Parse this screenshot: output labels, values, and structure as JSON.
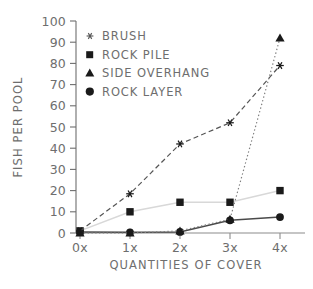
{
  "chart_data": {
    "type": "line",
    "title": "",
    "xlabel": "QUANTITIES OF COVER",
    "ylabel": "FISH PER POOL",
    "categories": [
      "0x",
      "1x",
      "2x",
      "3x",
      "4x"
    ],
    "x": [
      0,
      1,
      2,
      3,
      4
    ],
    "xlim": [
      -0.22,
      4.32
    ],
    "ylim": [
      0,
      100
    ],
    "yticks": [
      0,
      10,
      20,
      30,
      40,
      50,
      60,
      70,
      80,
      90,
      100
    ],
    "ytick_labels": [
      "0",
      "10",
      "20",
      "30",
      "40",
      "50",
      "60",
      "70",
      "80",
      "90",
      "100"
    ],
    "xtick_labels": [
      "0x",
      "1x",
      "2x",
      "3x",
      "4x"
    ],
    "grid": false,
    "legend_position": "upper-left-inside",
    "series": [
      {
        "name": "BRUSH",
        "marker": "asterisk",
        "linestyle": "dashed",
        "color": "#555555",
        "values": [
          1,
          18.5,
          42,
          52,
          79
        ]
      },
      {
        "name": "ROCK PILE",
        "marker": "square",
        "linestyle": "solid",
        "color": "#d8d8d8",
        "values": [
          1,
          10,
          14.5,
          14.5,
          20
        ]
      },
      {
        "name": "SIDE OVERHANG",
        "marker": "triangle",
        "linestyle": "dotted",
        "color": "#808080",
        "values": [
          0,
          0,
          1,
          6.5,
          92
        ]
      },
      {
        "name": "ROCK LAYER",
        "marker": "circle",
        "linestyle": "solid",
        "color": "#4a4a4a",
        "values": [
          0.5,
          0.3,
          0.5,
          6,
          7.5
        ]
      }
    ]
  },
  "axes": {
    "y_title": "FISH PER POOL",
    "x_title": "QUANTITIES OF COVER",
    "y_ticks": [
      "100",
      "90",
      "80",
      "70",
      "60",
      "50",
      "40",
      "30",
      "20",
      "10",
      "0"
    ],
    "x_ticks": [
      "0x",
      "1x",
      "2x",
      "3x",
      "4x"
    ]
  },
  "legend": {
    "entries": [
      {
        "label": "BRUSH",
        "marker": "asterisk-marker"
      },
      {
        "label": "ROCK PILE",
        "marker": "square-marker"
      },
      {
        "label": "SIDE OVERHANG",
        "marker": "triangle-marker"
      },
      {
        "label": "ROCK LAYER",
        "marker": "circle-marker"
      }
    ]
  },
  "colors": {
    "axis": "#6e6e6e",
    "text": "#6e6e6e",
    "brush": "#555555",
    "rock_pile": "#d8d8d8",
    "side_overhang": "#808080",
    "rock_layer": "#4a4a4a",
    "background": "#ffffff"
  }
}
